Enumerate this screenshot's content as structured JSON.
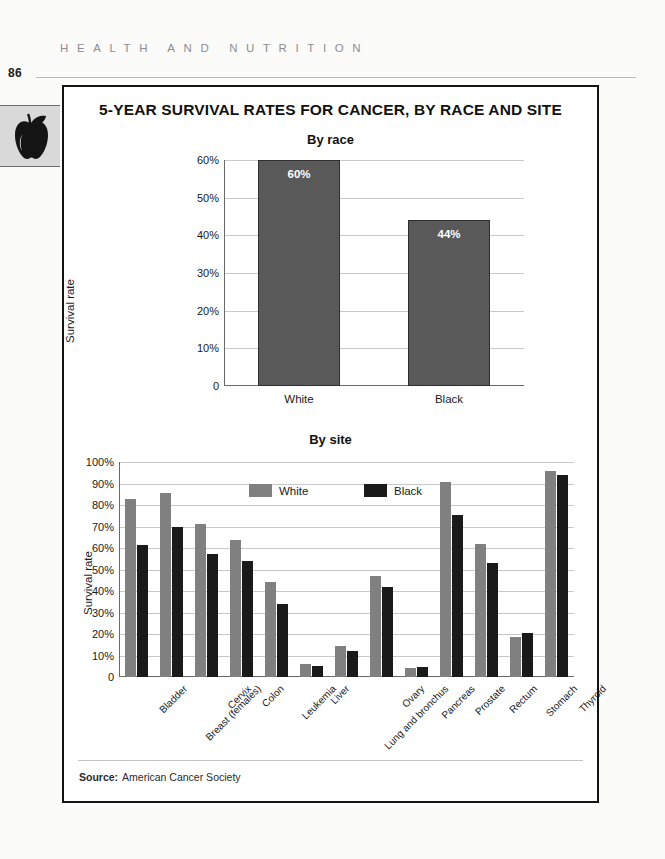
{
  "page": {
    "running_head": "HEALTH AND NUTRITION",
    "folio": "86",
    "side_tab_icon": "apple-icon"
  },
  "figure": {
    "title": "5-YEAR SURVIVAL RATES FOR CANCER, BY RACE AND SITE",
    "source_label": "Source:",
    "source_text": "American Cancer Society"
  },
  "colors": {
    "white_series": "#808080",
    "black_series": "#1a1a1a",
    "race_bar": "#595959",
    "gridline": "#c8c8cc",
    "frame": "#131313",
    "page_background": "#fbfbfa",
    "side_tab": "#d9d9d9"
  },
  "chart_data": [
    {
      "type": "bar",
      "title": "By race",
      "xlabel": "",
      "ylabel": "Survival rate",
      "categories": [
        "White",
        "Black"
      ],
      "values": [
        60,
        44
      ],
      "data_labels": [
        "60%",
        "44%"
      ],
      "ylim": [
        0,
        60
      ],
      "yticks": [
        0,
        10,
        20,
        30,
        40,
        50,
        60
      ],
      "ytick_labels": [
        "0",
        "10%",
        "20%",
        "30%",
        "40%",
        "50%",
        "60%"
      ],
      "grid": true,
      "legend": "none"
    },
    {
      "type": "bar",
      "title": "By site",
      "xlabel": "",
      "ylabel": "Survival rate",
      "categories": [
        "Bladder",
        "Breast (females)",
        "Cervix",
        "Colon",
        "Leukemia",
        "Liver",
        "Lung and bronchus",
        "Ovary",
        "Pancreas",
        "Prostate",
        "Rectum",
        "Stomach",
        "Thyroid"
      ],
      "series": [
        {
          "name": "White",
          "values": [
            83,
            85.5,
            71,
            63.5,
            44,
            6,
            14.5,
            47,
            4,
            90.5,
            62,
            18.5,
            96
          ]
        },
        {
          "name": "Black",
          "values": [
            61.5,
            70,
            57,
            54,
            34,
            5,
            12,
            42,
            4.5,
            75.5,
            53,
            20.5,
            94
          ]
        }
      ],
      "ylim": [
        0,
        100
      ],
      "yticks": [
        0,
        10,
        20,
        30,
        40,
        50,
        60,
        70,
        80,
        90,
        100
      ],
      "ytick_labels": [
        "0",
        "10%",
        "20%",
        "30%",
        "40%",
        "50%",
        "60%",
        "70%",
        "80%",
        "90%",
        "100%"
      ],
      "grid": true,
      "legend": "inside-top-center"
    }
  ]
}
